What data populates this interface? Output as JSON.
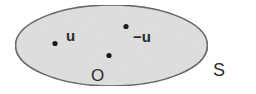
{
  "diagram": {
    "type": "set-diagram",
    "set": {
      "label": "S",
      "shape": "ellipse",
      "fill": "#e2e2e2",
      "stroke": "#444444"
    },
    "points": [
      {
        "id": "u",
        "label": "u"
      },
      {
        "id": "neg-u",
        "label": "−u"
      },
      {
        "id": "origin",
        "label": "O"
      }
    ]
  }
}
